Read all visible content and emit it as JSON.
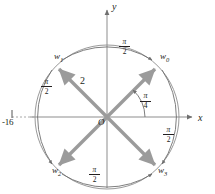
{
  "figure": {
    "axes": {
      "x_label": "x",
      "y_label": "y",
      "origin_label": "O"
    },
    "circle": {
      "radius_label": "2",
      "center": [
        107,
        117
      ],
      "radius_px": 72
    },
    "colors": {
      "vector": "#9b9b9b",
      "axis": "#8d8d8d",
      "circle": "#8d8d8d",
      "arc": "#7d7d7d",
      "text": "#231f20",
      "background": "#ffffff"
    },
    "real_axis_point": {
      "label": "-16",
      "tick": true,
      "dashed": true
    },
    "initial_angle": {
      "label_num": "π",
      "label_den": "4",
      "value": "π/4"
    },
    "separation_angle": {
      "label_num": "π",
      "label_den": "2",
      "value": "π/2"
    },
    "roots": [
      {
        "name": "w",
        "index": "0",
        "angle_deg": 45,
        "label": "w0"
      },
      {
        "name": "w",
        "index": "1",
        "angle_deg": 135,
        "label": "w1"
      },
      {
        "name": "w",
        "index": "2",
        "angle_deg": 225,
        "label": "w2"
      },
      {
        "name": "w",
        "index": "3",
        "angle_deg": 315,
        "label": "w3"
      }
    ],
    "arc_labels": [
      {
        "id": "arc-top",
        "num": "π",
        "den": "2"
      },
      {
        "id": "arc-left",
        "num": "π",
        "den": "2"
      },
      {
        "id": "arc-bottom",
        "num": "π",
        "den": "2"
      },
      {
        "id": "arc-right-bottom",
        "num": "π",
        "den": "2"
      }
    ]
  }
}
